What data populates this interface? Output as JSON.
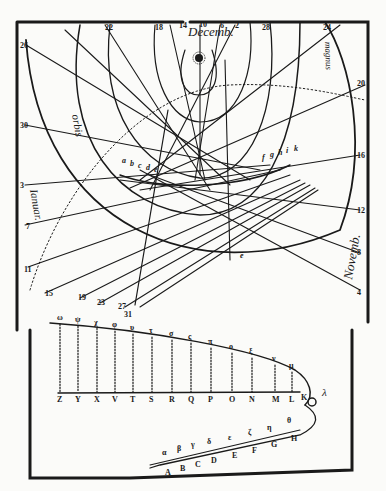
{
  "diagram": {
    "type": "historical astronomical woodcut",
    "colors": {
      "ink": "#1a1a1a",
      "paper": "#fbfbf9"
    },
    "month_labels": {
      "december": "Decemb.",
      "november": "Novemb.",
      "january": "Ianuar.",
      "orbis": "orbis",
      "magnus": "magnus"
    },
    "top_numbers": [
      "22",
      "18",
      "14",
      "10",
      "6",
      "2",
      "28",
      "24"
    ],
    "left_numbers": [
      "26",
      "30",
      "3",
      "7",
      "11",
      "15",
      "19",
      "23",
      "27",
      "31"
    ],
    "right_numbers": [
      "20",
      "16",
      "12",
      "8",
      "4"
    ],
    "arc_letters_left": [
      "a",
      "b",
      "c",
      "d",
      "e"
    ],
    "arc_letters_right": [
      "f",
      "g",
      "h",
      "i",
      "k"
    ],
    "arc_letter_bottom": "e",
    "upper_curve_letters": [
      "ω",
      "ψ",
      "χ",
      "φ",
      "υ",
      "τ",
      "σ",
      "ς",
      "π",
      "ο",
      "ξ",
      "ν",
      "μ",
      "λ"
    ],
    "lower_axis_letters": [
      "Z",
      "Y",
      "X",
      "V",
      "T",
      "S",
      "R",
      "Q",
      "P",
      "O",
      "N",
      "M",
      "L",
      "K"
    ],
    "bottom_upper_letters": [
      "α",
      "β",
      "γ",
      "δ",
      "ε",
      "ζ",
      "η",
      "θ"
    ],
    "bottom_lower_letters": [
      "A",
      "B",
      "C",
      "D",
      "E",
      "F",
      "G",
      "H"
    ],
    "sun_symbol": "☼"
  }
}
